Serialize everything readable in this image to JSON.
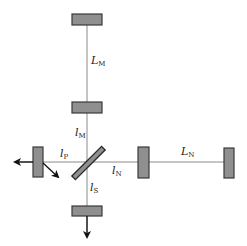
{
  "diagram": {
    "type": "optical-interferometer-schematic",
    "colors": {
      "background": "#ffffff",
      "beam": "#8a8a8a",
      "mirror_fill": "#8f8f8f",
      "mirror_stroke": "#3a3a3a",
      "arrow": "#111111",
      "text": "#222222"
    },
    "components": {
      "mirror_m_end": "mirror",
      "mirror_m_input": "mirror",
      "mirror_n_input": "mirror",
      "mirror_n_end": "mirror",
      "mirror_power_recycling": "mirror",
      "mirror_signal_recycling": "mirror",
      "beam_splitter": "beam splitter"
    },
    "labels": {
      "LM": {
        "main": "L",
        "sub": "M"
      },
      "lM": {
        "main": "l",
        "sub": "M"
      },
      "lP": {
        "main": "l",
        "sub": "P"
      },
      "lN": {
        "main": "l",
        "sub": "N"
      },
      "LN": {
        "main": "L",
        "sub": "N"
      },
      "lS": {
        "main": "l",
        "sub": "S"
      }
    },
    "arrows": {
      "input_output_left": "arrow-left",
      "reflected_diagonal": "arrow-down-right",
      "output_down": "arrow-down"
    }
  }
}
